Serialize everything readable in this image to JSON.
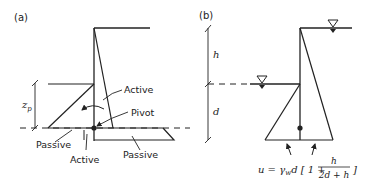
{
  "panel_a": {
    "label": "(a)",
    "annotations": {
      "active_upper": "Active",
      "pivot": "Pivot",
      "passive_left": "Passive",
      "active_lower": "Active",
      "passive_right": "Passive",
      "zp_symbol": "z",
      "zp_subscript": "p"
    }
  },
  "panel_b": {
    "label": "(b)",
    "dimensions": {
      "upper": "h",
      "lower": "d"
    },
    "formula": {
      "lhs": "u = γ",
      "sub_w": "w",
      "mid": "d [ 1 + ",
      "numerator": "h",
      "denominator": "2d + h",
      "close": "]"
    }
  },
  "colors": {
    "line": "#222222",
    "background": "#ffffff"
  }
}
